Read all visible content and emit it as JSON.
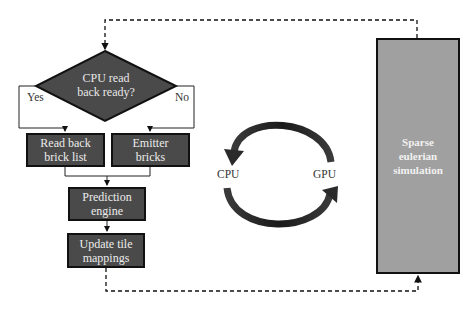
{
  "diagram": {
    "decision": {
      "label": "CPU read\nback ready?",
      "yes_label": "Yes",
      "no_label": "No"
    },
    "nodes": {
      "read_back": "Read back\nbrick list",
      "emitter": "Emitter\nbricks",
      "prediction": "Prediction\nengine",
      "update": "Update tile\nmappings",
      "simulation": "Sparse\neulerian\nsimulation"
    },
    "cycle": {
      "left_label": "CPU",
      "right_label": "GPU"
    },
    "colors": {
      "process_box": "#4a4a4a",
      "simulation_box": "#a0a0a0",
      "border": "#111111",
      "arrow": "#2a2a2a"
    }
  }
}
